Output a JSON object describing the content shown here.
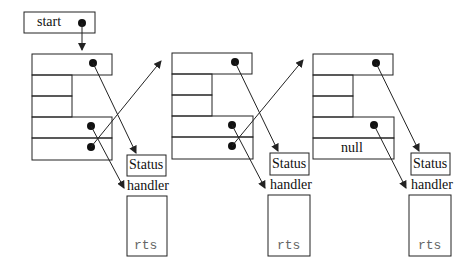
{
  "diagram": {
    "start_label": "start",
    "frames": [
      {
        "status_label": "Status",
        "handler_label": "handler",
        "rts_label": "rts",
        "slot_label": ""
      },
      {
        "status_label": "Status",
        "handler_label": "handler",
        "rts_label": "rts",
        "slot_label": ""
      },
      {
        "status_label": "Status",
        "handler_label": "handler",
        "rts_label": "rts",
        "slot_label": "null"
      }
    ],
    "colors": {
      "stroke": "#222222",
      "text": "#111111",
      "mono_text": "#666666",
      "background": "#ffffff"
    }
  }
}
